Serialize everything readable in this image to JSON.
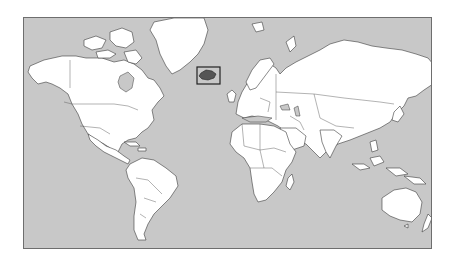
{
  "map": {
    "projection": "mercator",
    "colors": {
      "ocean": "#c8c8c8",
      "land": "#ffffff",
      "border": "#3a3a3a",
      "highlight_fill": "#555555",
      "highlight_box": "#222222"
    },
    "highlighted_country": {
      "name": "Iceland",
      "icon": "highlight-box-icon"
    }
  }
}
